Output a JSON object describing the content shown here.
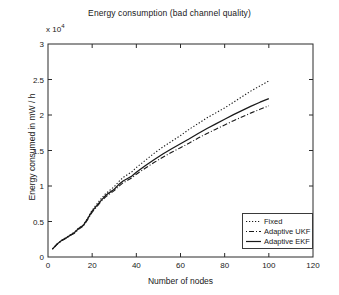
{
  "chart_data": {
    "type": "line",
    "title": "Energy consumption (bad channel quality)",
    "xlabel": "Number of nodes",
    "ylabel": "Energy consumed in mW / h",
    "y_multiplier_text": "x 10",
    "y_multiplier_exponent": "4",
    "y_multiplier_value": 10000,
    "xlim": [
      0,
      120
    ],
    "ylim": [
      0,
      30000
    ],
    "xticks": [
      0,
      20,
      40,
      60,
      80,
      100,
      120
    ],
    "xtick_labels": [
      "0",
      "20",
      "40",
      "60",
      "80",
      "100",
      "120"
    ],
    "yticks": [
      0,
      5000,
      10000,
      15000,
      20000,
      25000,
      30000
    ],
    "ytick_labels": [
      "0",
      "0.5",
      "1",
      "1.5",
      "2",
      "2.5",
      "3"
    ],
    "grid": false,
    "legend_position": "lower right",
    "x": [
      2,
      4,
      6,
      8,
      10,
      12,
      14,
      16,
      18,
      20,
      22,
      24,
      26,
      28,
      30,
      32,
      34,
      36,
      38,
      40,
      44,
      48,
      52,
      56,
      60,
      64,
      68,
      72,
      76,
      80,
      84,
      88,
      92,
      96,
      100
    ],
    "series": [
      {
        "name": "Fixed",
        "style": "dotted",
        "color": "#1a1a1a",
        "values": [
          1100,
          1800,
          2300,
          2700,
          3100,
          3500,
          4100,
          4500,
          5500,
          6600,
          7400,
          8200,
          8900,
          9400,
          9900,
          10600,
          11200,
          11600,
          12000,
          12600,
          13600,
          14600,
          15500,
          16300,
          17100,
          18000,
          18800,
          19600,
          20300,
          21000,
          21800,
          22600,
          23400,
          24100,
          24800
        ]
      },
      {
        "name": "Adaptive UKF",
        "style": "dashdot",
        "color": "#1a1a1a",
        "values": [
          1100,
          1750,
          2250,
          2600,
          3000,
          3350,
          3950,
          4350,
          5300,
          6300,
          7050,
          7800,
          8450,
          8900,
          9350,
          9950,
          10450,
          10800,
          11150,
          11650,
          12500,
          13300,
          14050,
          14750,
          15400,
          16050,
          16750,
          17400,
          18000,
          18600,
          19200,
          19750,
          20300,
          20800,
          21300
        ]
      },
      {
        "name": "Adaptive EKF",
        "style": "solid",
        "color": "#1a1a1a",
        "values": [
          1100,
          1800,
          2300,
          2650,
          3050,
          3450,
          4050,
          4450,
          5400,
          6450,
          7200,
          7950,
          8650,
          9100,
          9550,
          10200,
          10700,
          11050,
          11400,
          11950,
          12850,
          13700,
          14500,
          15250,
          15950,
          16650,
          17400,
          18100,
          18750,
          19400,
          20050,
          20650,
          21250,
          21800,
          22300
        ]
      }
    ]
  },
  "legend": {
    "entries": [
      {
        "label": "Fixed"
      },
      {
        "label": "Adaptive UKF"
      },
      {
        "label": "Adaptive EKF"
      }
    ]
  }
}
